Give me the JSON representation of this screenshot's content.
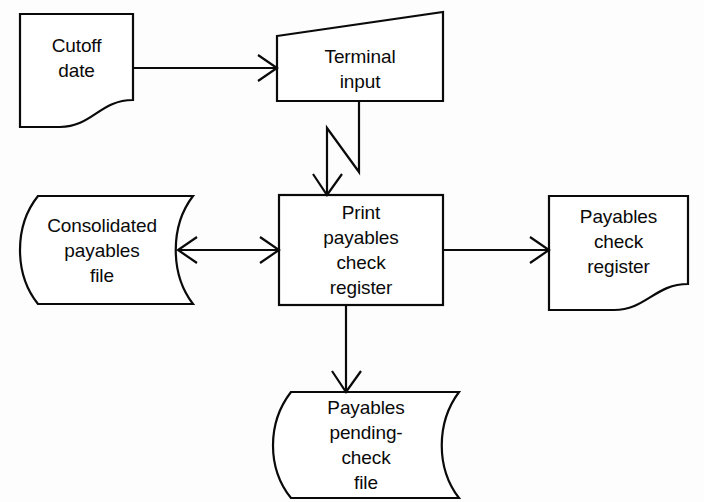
{
  "diagram": {
    "background_color": "#fdfdfd",
    "line_color": "#0a0a0a",
    "shape_fill": "#ffffff",
    "nodes": [
      {
        "id": "cutoff-date",
        "shape": "document",
        "lines": [
          "Cutoff",
          "date"
        ]
      },
      {
        "id": "terminal-input",
        "shape": "manual-input",
        "lines": [
          "Terminal",
          "input"
        ]
      },
      {
        "id": "consolidated-payables-file",
        "shape": "magnetic-disk",
        "lines": [
          "Consolidated",
          "payables",
          "file"
        ]
      },
      {
        "id": "print-payables-check-register",
        "shape": "process",
        "lines": [
          "Print",
          "payables",
          "check",
          "register"
        ]
      },
      {
        "id": "payables-check-register",
        "shape": "document",
        "lines": [
          "Payables",
          "check",
          "register"
        ]
      },
      {
        "id": "payables-pending-check-file",
        "shape": "magnetic-disk",
        "lines": [
          "Payables",
          "pending-",
          "check",
          "file"
        ]
      }
    ],
    "connectors": [
      {
        "id": "cutoff-to-terminal",
        "from": "cutoff-date",
        "to": "terminal-input",
        "direction": "right",
        "style": "straight"
      },
      {
        "id": "terminal-to-print",
        "from": "terminal-input",
        "to": "print-payables-check-register",
        "direction": "down",
        "style": "zigzag"
      },
      {
        "id": "file-to-print",
        "from": "consolidated-payables-file",
        "to": "print-payables-check-register",
        "direction": "bidirectional",
        "style": "straight"
      },
      {
        "id": "print-to-register",
        "from": "print-payables-check-register",
        "to": "payables-check-register",
        "direction": "right",
        "style": "straight"
      },
      {
        "id": "print-to-pending-file",
        "from": "print-payables-check-register",
        "to": "payables-pending-check-file",
        "direction": "down",
        "style": "straight"
      }
    ]
  }
}
